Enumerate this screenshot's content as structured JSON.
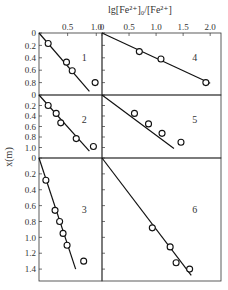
{
  "figure": {
    "top_label": "lg[Fe²⁺]₀/[Fe²⁺]",
    "y_label": "x(m)"
  },
  "chart_data": [
    {
      "type": "scatter",
      "panel": "1",
      "xlabel": "lg[Fe²⁺]₀/[Fe²⁺]",
      "ylabel": "x(m)",
      "xlim": [
        0,
        1.1
      ],
      "ylim": [
        0,
        1.0
      ],
      "x_ticks": [
        "0.5",
        "1.0"
      ],
      "y_ticks": [
        "0",
        "0.2",
        "0.4",
        "0.6",
        "0.8"
      ],
      "points": [
        [
          0.16,
          0.17
        ],
        [
          0.48,
          0.47
        ],
        [
          0.58,
          0.61
        ],
        [
          0.98,
          0.8
        ]
      ],
      "fit_line": [
        [
          0,
          0
        ],
        [
          0.88,
          0.94
        ]
      ]
    },
    {
      "type": "scatter",
      "panel": "4",
      "xlabel": "lg[Fe²⁺]₀/[Fe²⁺]",
      "ylabel": "x(m)",
      "xlim": [
        0,
        2.2
      ],
      "ylim": [
        0,
        1.0
      ],
      "x_ticks": [
        "0",
        "0.5",
        "1.0",
        "1.5",
        "2.0"
      ],
      "y_ticks": [
        "0",
        "0.2",
        "0.4",
        "0.6",
        "0.8"
      ],
      "points": [
        [
          0.69,
          0.3
        ],
        [
          1.09,
          0.42
        ],
        [
          1.92,
          0.8
        ]
      ],
      "fit_line": [
        [
          0,
          0
        ],
        [
          2.0,
          0.81
        ]
      ]
    },
    {
      "type": "scatter",
      "panel": "2",
      "xlabel": "lg[Fe²⁺]₀/[Fe²⁺]",
      "ylabel": "x(m)",
      "xlim": [
        0,
        1.1
      ],
      "ylim": [
        0,
        1.2
      ],
      "y_ticks": [
        "0",
        "0.2",
        "0.4",
        "0.6",
        "0.8",
        "1.0"
      ],
      "points": [
        [
          0.16,
          0.2
        ],
        [
          0.3,
          0.35
        ],
        [
          0.38,
          0.53
        ],
        [
          0.65,
          0.83
        ],
        [
          0.95,
          0.98
        ]
      ],
      "fit_line": [
        [
          0,
          0
        ],
        [
          0.88,
          1.07
        ]
      ]
    },
    {
      "type": "scatter",
      "panel": "5",
      "xlabel": "lg[Fe²⁺]₀/[Fe²⁺]",
      "ylabel": "x(m)",
      "xlim": [
        0,
        2.2
      ],
      "ylim": [
        0,
        1.2
      ],
      "y_ticks": [
        "0",
        "0.2",
        "0.4",
        "0.6",
        "0.8",
        "1.0"
      ],
      "points": [
        [
          0.6,
          0.35
        ],
        [
          0.86,
          0.55
        ],
        [
          1.11,
          0.73
        ],
        [
          1.46,
          0.9
        ]
      ],
      "fit_line": [
        [
          0,
          0
        ],
        [
          1.33,
          1.02
        ]
      ]
    },
    {
      "type": "scatter",
      "panel": "3",
      "xlabel": "lg[Fe²⁺]₀/[Fe²⁺]",
      "ylabel": "x(m)",
      "xlim": [
        0,
        1.1
      ],
      "ylim": [
        0,
        1.55
      ],
      "y_ticks": [
        "0",
        "0.2",
        "0.4",
        "0.6",
        "0.8",
        "1.0",
        "1.2",
        "1.4"
      ],
      "points": [
        [
          0.12,
          0.28
        ],
        [
          0.28,
          0.66
        ],
        [
          0.36,
          0.8
        ],
        [
          0.42,
          0.95
        ],
        [
          0.49,
          1.1
        ],
        [
          0.78,
          1.3
        ]
      ],
      "fit_line": [
        [
          0,
          0
        ],
        [
          0.64,
          1.4
        ]
      ]
    },
    {
      "type": "scatter",
      "panel": "6",
      "xlabel": "lg[Fe²⁺]₀/[Fe²⁺]",
      "ylabel": "x(m)",
      "xlim": [
        0,
        2.2
      ],
      "ylim": [
        0,
        1.55
      ],
      "y_ticks": [
        "0",
        "0.2",
        "0.4",
        "0.6",
        "0.8",
        "1.0",
        "1.2",
        "1.4"
      ],
      "points": [
        [
          0.93,
          0.88
        ],
        [
          1.26,
          1.12
        ],
        [
          1.37,
          1.32
        ],
        [
          1.62,
          1.4
        ]
      ],
      "fit_line": [
        [
          0,
          0
        ],
        [
          1.65,
          1.48
        ]
      ]
    }
  ]
}
